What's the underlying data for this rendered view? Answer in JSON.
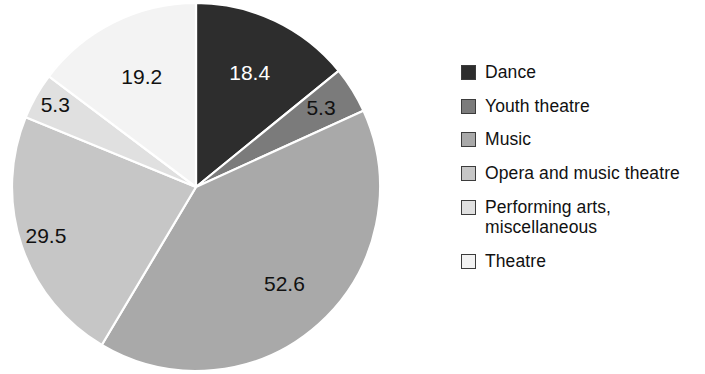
{
  "chart_data": {
    "type": "pie",
    "title": "",
    "subtitle": "",
    "xlabel": "",
    "ylabel": "",
    "legend_position": "right",
    "grid": false,
    "start_angle_deg": 0,
    "direction": "clockwise",
    "total": 130.3,
    "categories": [
      "Dance",
      "Youth theatre",
      "Music",
      "Opera and music theatre",
      "Performing arts, miscellaneous",
      "Theatre"
    ],
    "values": [
      18.4,
      5.3,
      52.6,
      29.5,
      5.3,
      19.2
    ],
    "value_labels": [
      "18.4",
      "5.3",
      "52.6",
      "29.5",
      "5.3",
      "19.2"
    ],
    "colors": [
      "#2d2d2d",
      "#7b7b7b",
      "#a9a9a9",
      "#c6c6c6",
      "#e0e0e0",
      "#f3f3f3"
    ],
    "label_text_colors": [
      "#ffffff",
      "#111111",
      "#111111",
      "#111111",
      "#111111",
      "#111111"
    ],
    "slices": [
      {
        "label": "Dance",
        "value": 18.4,
        "display": "18.4",
        "color": "#2d2d2d",
        "text_color": "#ffffff",
        "percent_of_total": 14.1
      },
      {
        "label": "Youth theatre",
        "value": 5.3,
        "display": "5.3",
        "color": "#7b7b7b",
        "text_color": "#111111",
        "percent_of_total": 4.1
      },
      {
        "label": "Music",
        "value": 52.6,
        "display": "52.6",
        "color": "#a9a9a9",
        "text_color": "#111111",
        "percent_of_total": 40.4
      },
      {
        "label": "Opera and music theatre",
        "value": 29.5,
        "display": "29.5",
        "color": "#c6c6c6",
        "text_color": "#111111",
        "percent_of_total": 22.6
      },
      {
        "label": "Performing arts, miscellaneous",
        "value": 5.3,
        "display": "5.3",
        "color": "#e0e0e0",
        "text_color": "#111111",
        "percent_of_total": 4.1
      },
      {
        "label": "Theatre",
        "value": 19.2,
        "display": "19.2",
        "color": "#f3f3f3",
        "text_color": "#111111",
        "percent_of_total": 14.7
      }
    ]
  },
  "legend": {
    "items": [
      {
        "label": "Dance",
        "color": "#2d2d2d"
      },
      {
        "label": "Youth theatre",
        "color": "#7b7b7b"
      },
      {
        "label": "Music",
        "color": "#a9a9a9"
      },
      {
        "label": "Opera and music theatre",
        "color": "#c6c6c6"
      },
      {
        "label": "Performing arts,\nmiscellaneous",
        "color": "#e0e0e0"
      },
      {
        "label": "Theatre",
        "color": "#f3f3f3"
      }
    ]
  }
}
